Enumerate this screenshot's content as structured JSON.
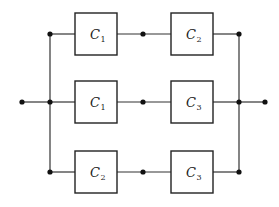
{
  "diagram": {
    "type": "parallel-series reliability block diagram",
    "colors": {
      "line": "#333333",
      "box_border": "#222222",
      "node": "#111111",
      "background": "#ffffff"
    },
    "input_terminal": {
      "x": 22,
      "y": 102
    },
    "output_terminal": {
      "x": 265,
      "y": 102
    },
    "left_bus_x": 50,
    "right_bus_x": 239,
    "rows": [
      {
        "y": 34,
        "components": [
          {
            "letter": "C",
            "subscript": "1",
            "x": 75,
            "y": 13,
            "w": 42,
            "h": 42
          },
          {
            "letter": "C",
            "subscript": "2",
            "x": 171,
            "y": 13,
            "w": 42,
            "h": 42
          }
        ],
        "mid_node_x": 143
      },
      {
        "y": 102,
        "components": [
          {
            "letter": "C",
            "subscript": "1",
            "x": 75,
            "y": 81,
            "w": 42,
            "h": 42
          },
          {
            "letter": "C",
            "subscript": "3",
            "x": 171,
            "y": 81,
            "w": 42,
            "h": 42
          }
        ],
        "mid_node_x": 143
      },
      {
        "y": 172,
        "components": [
          {
            "letter": "C",
            "subscript": "2",
            "x": 75,
            "y": 151,
            "w": 42,
            "h": 42
          },
          {
            "letter": "C",
            "subscript": "3",
            "x": 171,
            "y": 151,
            "w": 42,
            "h": 42
          }
        ],
        "mid_node_x": 143
      }
    ]
  }
}
